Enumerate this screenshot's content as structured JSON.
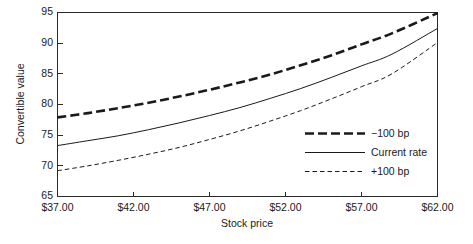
{
  "chart_data": {
    "type": "line",
    "title": "",
    "xlabel": "Stock price",
    "ylabel": "Convertible value",
    "xlim": [
      37,
      62
    ],
    "ylim": [
      65,
      95
    ],
    "grid": false,
    "legend_position": "inside-right",
    "x_tick_labels": [
      "$37.00",
      "$42.00",
      "$47.00",
      "$52.00",
      "$57.00",
      "$62.00"
    ],
    "x_ticks": [
      37,
      42,
      47,
      52,
      57,
      62
    ],
    "y_tick_labels": [
      "65",
      "70",
      "75",
      "80",
      "85",
      "90",
      "95"
    ],
    "y_ticks": [
      65,
      70,
      75,
      80,
      85,
      90,
      95
    ],
    "x": [
      37,
      39,
      41,
      43,
      45,
      47,
      49,
      51,
      53,
      55,
      57,
      59,
      62
    ],
    "series": [
      {
        "name": "-100 bp",
        "style": "thick-dashed",
        "values": [
          77.9,
          78.6,
          79.4,
          80.3,
          81.3,
          82.4,
          83.6,
          84.9,
          86.4,
          88.0,
          89.8,
          91.6,
          94.9
        ]
      },
      {
        "name": "Current rate",
        "style": "solid",
        "values": [
          73.3,
          74.1,
          74.9,
          75.9,
          77.0,
          78.2,
          79.5,
          81.0,
          82.6,
          84.4,
          86.3,
          88.2,
          92.4
        ]
      },
      {
        "name": "+100 bp",
        "style": "fine-dashed",
        "values": [
          69.2,
          70.0,
          70.9,
          71.9,
          73.0,
          74.3,
          75.7,
          77.3,
          79.0,
          80.9,
          82.9,
          85.0,
          90.1
        ]
      }
    ]
  },
  "legend": {
    "entries": [
      {
        "label": "−100 bp",
        "style": "thick-dashed"
      },
      {
        "label": "Current rate",
        "style": "solid"
      },
      {
        "label": "+100 bp",
        "style": "fine-dashed"
      }
    ]
  },
  "axes": {
    "x_title": "Stock price",
    "y_title": "Convertible value"
  },
  "colors": {
    "line": "#1a1a1a",
    "frame": "#2b2b2b",
    "background": "#ffffff"
  }
}
